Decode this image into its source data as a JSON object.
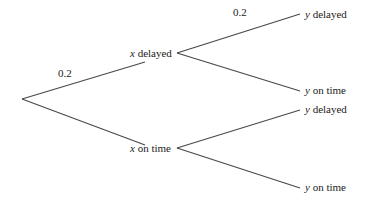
{
  "diagram": {
    "type": "probability-tree",
    "root": {
      "x": 22,
      "y": 99
    },
    "colors": {
      "line": "#4a4a4a",
      "text": "#222222",
      "background": "#ffffff"
    },
    "level1": [
      {
        "id": "x-delayed",
        "var": "x",
        "text": " delayed",
        "prob": "0.2",
        "edge_end": {
          "x": 145,
          "y": 62
        },
        "label_pos": {
          "x": 130,
          "y": 57
        },
        "prob_pos": {
          "x": 58,
          "y": 77
        },
        "vertex": {
          "x": 177,
          "y": 53
        }
      },
      {
        "id": "x-on-time",
        "var": "x",
        "text": " on time",
        "prob": "",
        "edge_end": {
          "x": 145,
          "y": 145
        },
        "label_pos": {
          "x": 130,
          "y": 152
        },
        "vertex": {
          "x": 177,
          "y": 148
        }
      }
    ],
    "level2": [
      {
        "parent": "x-delayed",
        "var": "y",
        "text": " delayed",
        "prob": "0.2",
        "edge_end": {
          "x": 300,
          "y": 14
        },
        "label_pos": {
          "x": 305,
          "y": 18
        },
        "prob_pos": {
          "x": 233,
          "y": 16
        }
      },
      {
        "parent": "x-delayed",
        "var": "y",
        "text": " on time",
        "prob": "",
        "edge_end": {
          "x": 300,
          "y": 91
        },
        "label_pos": {
          "x": 305,
          "y": 94
        }
      },
      {
        "parent": "x-on-time",
        "var": "y",
        "text": " delayed",
        "prob": "",
        "edge_end": {
          "x": 300,
          "y": 110
        },
        "label_pos": {
          "x": 305,
          "y": 113
        }
      },
      {
        "parent": "x-on-time",
        "var": "y",
        "text": " on time",
        "prob": "",
        "edge_end": {
          "x": 300,
          "y": 188
        },
        "label_pos": {
          "x": 305,
          "y": 191
        }
      }
    ]
  },
  "labels": {
    "x_delayed_var": "x",
    "x_delayed_text": " delayed",
    "x_on_time_var": "x",
    "x_on_time_text": " on time",
    "y1_var": "y",
    "y1_text": " delayed",
    "y2_var": "y",
    "y2_text": " on time",
    "y3_var": "y",
    "y3_text": " delayed",
    "y4_var": "y",
    "y4_text": " on time",
    "prob_x_delayed": "0.2",
    "prob_y_delayed_given_x_delayed": "0.2"
  }
}
